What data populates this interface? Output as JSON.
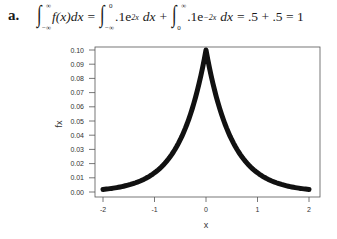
{
  "problem": {
    "label": "a.",
    "formula": {
      "lhs_integrand": "f(x)dx",
      "lhs_lower": "−∞",
      "lhs_upper": "∞",
      "eq1": "=",
      "term1_lower": "−∞",
      "term1_upper": "0",
      "term1_coef": ".1e",
      "term1_exp": "2x",
      "term1_dx": "dx",
      "plus": "+",
      "term2_lower": "0",
      "term2_upper": "∞",
      "term2_coef": ".1e",
      "term2_exp": "−2x",
      "term2_dx": "dx",
      "result": "= .5 + .5 = 1"
    }
  },
  "chart_data": {
    "type": "line",
    "title": "",
    "xlabel": "x",
    "ylabel": "fx",
    "xlim": [
      -2,
      2
    ],
    "ylim": [
      0,
      0.1
    ],
    "x_ticks": [
      "-2",
      "-1",
      "0",
      "1",
      "2"
    ],
    "y_ticks": [
      "0.00",
      "0.01",
      "0.02",
      "0.03",
      "0.04",
      "0.05",
      "0.06",
      "0.07",
      "0.08",
      "0.09",
      "0.10"
    ],
    "grid": false,
    "legend": null,
    "series": [
      {
        "name": "fx = 0.1·e^(-2|x|)",
        "x": [
          -2,
          -1.75,
          -1.5,
          -1.25,
          -1,
          -0.75,
          -0.5,
          -0.25,
          0,
          0.25,
          0.5,
          0.75,
          1,
          1.25,
          1.5,
          1.75,
          2
        ],
        "values": [
          0.0018,
          0.003,
          0.005,
          0.0082,
          0.0135,
          0.0223,
          0.0368,
          0.0607,
          0.1,
          0.0607,
          0.0368,
          0.0223,
          0.0135,
          0.0082,
          0.005,
          0.003,
          0.0018
        ]
      }
    ],
    "line_color": "#111111"
  }
}
